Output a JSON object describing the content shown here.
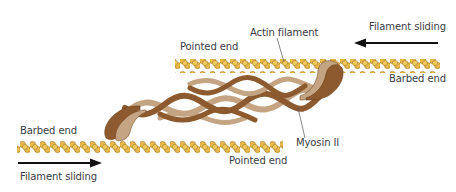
{
  "figure": {
    "labels": {
      "actin_filament": "Actin filament",
      "sliding_top": "Filament sliding",
      "pointed_end_top": "Pointed end",
      "barbed_end_top": "Barbed end",
      "barbed_end_bottom": "Barbed end",
      "pointed_end_bottom": "Pointed end",
      "myosin": "Myosin II",
      "sliding_bottom": "Filament sliding"
    },
    "arrows": {
      "top": {
        "direction": "left"
      },
      "bottom": {
        "direction": "right"
      }
    },
    "colors": {
      "actin_fill": "#e8b94a",
      "actin_outline": "#9a7420",
      "myosin_dark": "#8c5a2e",
      "myosin_light": "#c4a482",
      "arrow": "#111111",
      "text": "#3c3c46"
    }
  }
}
